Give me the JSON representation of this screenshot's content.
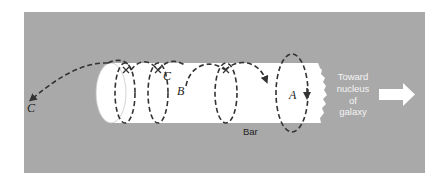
{
  "diagram": {
    "colors": {
      "panel_background": "#a9a9a9",
      "bar_fill": "#ffffff",
      "orbit_stroke": "#333333",
      "arrow_fill": "#ffffff"
    },
    "labels": {
      "orbit_c_outer": "C",
      "orbit_c_inner": "C",
      "orbit_b": "B",
      "orbit_a": "A",
      "bar": "Bar",
      "direction_line1": "Toward",
      "direction_line2": "nucleus",
      "direction_line3": "of",
      "direction_line4": "galaxy"
    },
    "elements": [
      {
        "id": "bar",
        "type": "cylinder",
        "label": "Bar"
      },
      {
        "id": "orbit-a",
        "type": "closed loop orbit",
        "label": "A"
      },
      {
        "id": "orbit-b",
        "type": "spiral orbit along bar",
        "label": "B"
      },
      {
        "id": "orbit-c",
        "type": "escaping spiral orbit",
        "label": "C"
      },
      {
        "id": "direction-arrow",
        "type": "block arrow",
        "label": "Toward nucleus of galaxy"
      }
    ]
  }
}
